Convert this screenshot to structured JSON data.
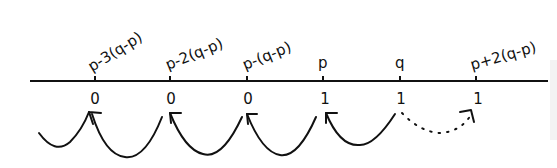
{
  "diagram": {
    "type": "number-line",
    "line": {
      "x1": 30,
      "x2": 548,
      "y": 81
    },
    "points": [
      {
        "label": "p-3(q-p)",
        "value": "0",
        "x": 95
      },
      {
        "label": "p-2(q-p)",
        "value": "0",
        "x": 170
      },
      {
        "label": "p-(q-p)",
        "value": "0",
        "x": 247
      },
      {
        "label": "p",
        "value": "1",
        "x": 323
      },
      {
        "label": "q",
        "value": "1",
        "x": 400
      },
      {
        "label": "p+2(q-p)",
        "value": "1",
        "x": 476
      }
    ],
    "arrows": [
      {
        "from": "left-edge",
        "to": "p-3(q-p)",
        "style": "solid"
      },
      {
        "from": "p-2(q-p)",
        "to": "p-3(q-p)",
        "style": "solid"
      },
      {
        "from": "p-(q-p)",
        "to": "p-2(q-p)",
        "style": "solid"
      },
      {
        "from": "p",
        "to": "p-(q-p)",
        "style": "solid"
      },
      {
        "from": "q",
        "to": "p",
        "style": "solid"
      },
      {
        "from": "q",
        "to": "p+2(q-p)",
        "style": "dotted"
      }
    ],
    "colors": {
      "ink": "#111111",
      "background": "#ffffff"
    }
  }
}
